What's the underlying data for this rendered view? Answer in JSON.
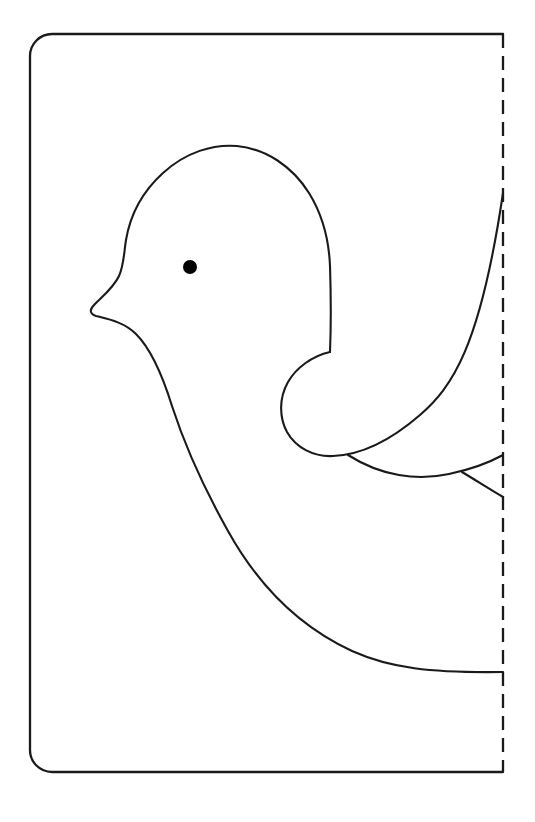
{
  "document": {
    "kind": "craft-template",
    "title": "Bird Fold-Out Template",
    "background_color": "#ffffff",
    "ink_color": "#1a1a1a",
    "canvas": {
      "width": 535,
      "height": 822
    }
  },
  "card": {
    "name": "card-outline",
    "description": "Rounded rectangle card border, open on the right side",
    "left": 30,
    "top": 34,
    "right": 503,
    "bottom": 772,
    "corner_radius": 22,
    "stroke_color": "#1a1a1a",
    "stroke_width": 2.3,
    "path": "M 503 34 L 52 34 A 22 22 0 0 0 30 56 L 30 750 A 22 22 0 0 0 52 772 L 503 772"
  },
  "fold_line": {
    "name": "fold-line",
    "description": "Vertical dashed fold line at the right edge",
    "x": 503,
    "y_start": 34,
    "y_end": 772,
    "dash_length": 14,
    "dash_gap": 8,
    "stroke_color": "#1a1a1a",
    "stroke_width": 2.3,
    "path": "M 503 34 L 503 772"
  },
  "bird": {
    "name": "bird-silhouette",
    "description": "Half-profile dove facing left, mirrored across the fold line",
    "stroke_color": "#1a1a1a",
    "stroke_width": 2.1,
    "parts": [
      {
        "name": "head-and-body-outline",
        "label": "Head, beak, breast and belly contour",
        "path": "M 503 672 C 430 673 390 668 352 651 C 300 627 258 585 228 531 C 200 481 183 440 172 406 C 163 377 152 350 136 334 C 124 322 108 319 96 316 C 90 314 89 310 94 305 C 104 295 114 287 119 276 C 124 265 124 252 126 240 C 130 216 142 192 163 173 C 186 152 213 144 237 146 C 266 149 292 166 309 193 C 322 214 329 241 330 266 C 331 296 331 327 330 352"
      },
      {
        "name": "wing-upper-contour",
        "label": "Upper wing sweeping to the fold line",
        "path": "M 330 352 C 312 356 296 368 288 382 C 279 398 279 417 287 432 C 296 448 314 457 333 456 C 360 455 390 441 420 415 C 452 387 480 348 503 193"
      },
      {
        "name": "wing-lower-contour",
        "label": "Lower wing / tail feather edge",
        "path": "M 348 455 C 381 476 417 481 449 474 C 473 469 492 461 503 455"
      },
      {
        "name": "tail-feather-split",
        "label": "Small feather split arc below the wing",
        "path": "M 462 472 C 477 481 491 490 503 497"
      }
    ]
  },
  "eye": {
    "name": "bird-eye",
    "shape": "filled-circle",
    "center_x": 190,
    "center_y": 267,
    "radius": 7,
    "fill_color": "#000000"
  }
}
